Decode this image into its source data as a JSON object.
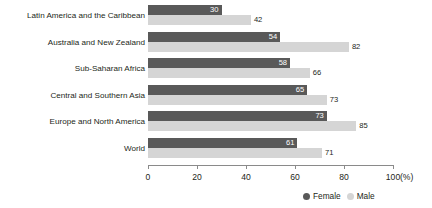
{
  "chart_data": {
    "type": "bar",
    "orientation": "horizontal",
    "title": "",
    "xlabel": "(%)",
    "ylabel": "",
    "xlim": [
      0,
      100
    ],
    "xticks": [
      0,
      20,
      40,
      60,
      80,
      100
    ],
    "grid": false,
    "legend_position": "bottom-right",
    "categories": [
      "Latin America and the Caribbean",
      "Australia and New Zealand",
      "Sub-Saharan Africa",
      "Central and Southern Asia",
      "Europe and North America",
      "World"
    ],
    "series": [
      {
        "name": "Female",
        "color": "#595959",
        "values": [
          30,
          54,
          58,
          65,
          73,
          61
        ]
      },
      {
        "name": "Male",
        "color": "#d5d5d5",
        "values": [
          42,
          82,
          66,
          73,
          85,
          71
        ]
      }
    ]
  },
  "axis": {
    "tick_labels": [
      "0",
      "20",
      "40",
      "60",
      "80",
      "100"
    ],
    "unit": "(%)"
  },
  "legend": {
    "items": [
      {
        "label": "Female",
        "color": "#595959"
      },
      {
        "label": "Male",
        "color": "#d5d5d5"
      }
    ]
  }
}
